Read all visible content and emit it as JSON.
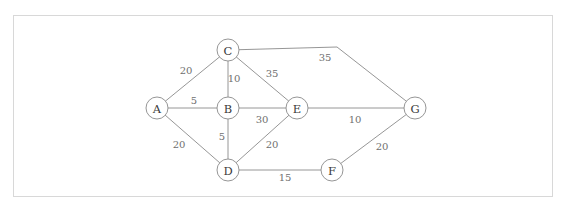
{
  "diagram": {
    "frame": {
      "x": 13,
      "y": 15,
      "width": 539,
      "height": 181
    },
    "colors": {
      "background": "#ffffff",
      "frame_stroke": "#d8d8d8",
      "edge_stroke": "#8a8a8a",
      "node_stroke": "#8a8a8a",
      "node_fill": "#ffffff",
      "node_label": "#3a3a3a",
      "weight_label": "#6f6f6f"
    },
    "node_radius": 11,
    "nodes": [
      {
        "id": "A",
        "label": "A",
        "x": 157,
        "y": 108
      },
      {
        "id": "B",
        "label": "B",
        "x": 228,
        "y": 108
      },
      {
        "id": "C",
        "label": "C",
        "x": 228,
        "y": 50
      },
      {
        "id": "D",
        "label": "D",
        "x": 228,
        "y": 170
      },
      {
        "id": "E",
        "label": "E",
        "x": 297,
        "y": 108
      },
      {
        "id": "F",
        "label": "F",
        "x": 332,
        "y": 170
      },
      {
        "id": "G",
        "label": "G",
        "x": 415,
        "y": 108
      }
    ],
    "edges": [
      {
        "id": "A-C",
        "from": "A",
        "to": "C",
        "weight": "20",
        "label_x": 186,
        "label_y": 70
      },
      {
        "id": "A-B",
        "from": "A",
        "to": "B",
        "weight": "5",
        "label_x": 194,
        "label_y": 100
      },
      {
        "id": "A-D",
        "from": "A",
        "to": "D",
        "weight": "20",
        "label_x": 179,
        "label_y": 144
      },
      {
        "id": "C-B",
        "from": "C",
        "to": "B",
        "weight": "10",
        "label_x": 234,
        "label_y": 78
      },
      {
        "id": "C-E",
        "from": "C",
        "to": "E",
        "weight": "35",
        "label_x": 272,
        "label_y": 73
      },
      {
        "id": "C-G",
        "from": "C",
        "to": "G",
        "weight": "35",
        "label_x": 325,
        "label_y": 57,
        "bend": {
          "x": 337,
          "y": 47
        }
      },
      {
        "id": "B-E",
        "from": "B",
        "to": "E",
        "weight": "30",
        "label_x": 262,
        "label_y": 119
      },
      {
        "id": "B-D",
        "from": "B",
        "to": "D",
        "weight": "5",
        "label_x": 222,
        "label_y": 136
      },
      {
        "id": "D-E",
        "from": "D",
        "to": "E",
        "weight": "20",
        "label_x": 272,
        "label_y": 144
      },
      {
        "id": "D-F",
        "from": "D",
        "to": "F",
        "weight": "15",
        "label_x": 285,
        "label_y": 177
      },
      {
        "id": "E-G",
        "from": "E",
        "to": "G",
        "weight": "10",
        "label_x": 355,
        "label_y": 119
      },
      {
        "id": "F-G",
        "from": "F",
        "to": "G",
        "weight": "20",
        "label_x": 382,
        "label_y": 146
      }
    ]
  }
}
